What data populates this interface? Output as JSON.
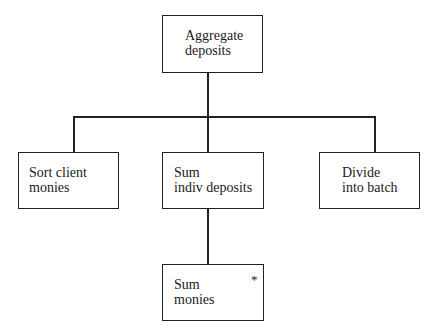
{
  "diagram": {
    "type": "hierarchy-chart",
    "root": {
      "label_line1": "Aggregate",
      "label_line2": "deposits"
    },
    "children": [
      {
        "label_line1": "Sort client",
        "label_line2": "monies"
      },
      {
        "label_line1": "Sum",
        "label_line2": "indiv deposits"
      },
      {
        "label_line1": "Divide",
        "label_line2": "into batch"
      }
    ],
    "grandchild": {
      "label_line1": "Sum",
      "label_line2": "monies",
      "marker": "*"
    }
  }
}
